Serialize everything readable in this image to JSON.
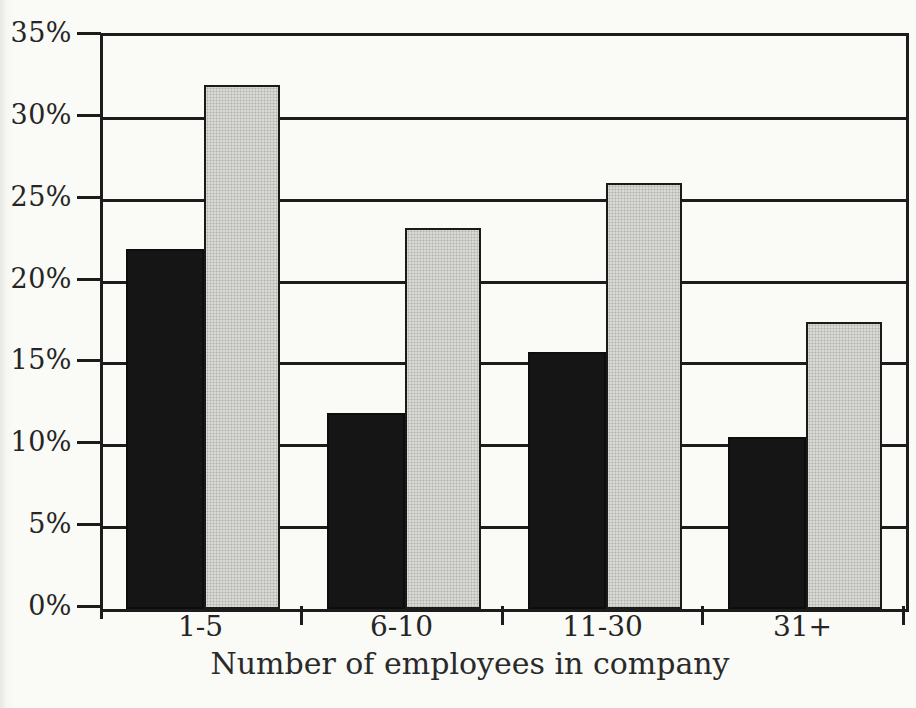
{
  "page": {
    "background": "#fafaf7",
    "ink_color": "#1c1c1c",
    "text_color": "#252525"
  },
  "chart_data": {
    "type": "bar",
    "xlabel": "Number of employees in company",
    "categories": [
      "1-5",
      "6-10",
      "11-30",
      "31+"
    ],
    "series": [
      {
        "name": "black",
        "color": "#151515",
        "values": [
          22,
          12,
          15.7,
          10.5
        ]
      },
      {
        "name": "light-gray",
        "color": "#d9d9d6",
        "values": [
          32,
          23.3,
          26,
          17.5
        ]
      }
    ],
    "unit": "%",
    "ylim": [
      0,
      35
    ],
    "y_ticks": [
      "0%",
      "5%",
      "10%",
      "15%",
      "20%",
      "25%",
      "30%",
      "35%"
    ],
    "grid": "horizontal",
    "legend": "none",
    "title": ""
  }
}
